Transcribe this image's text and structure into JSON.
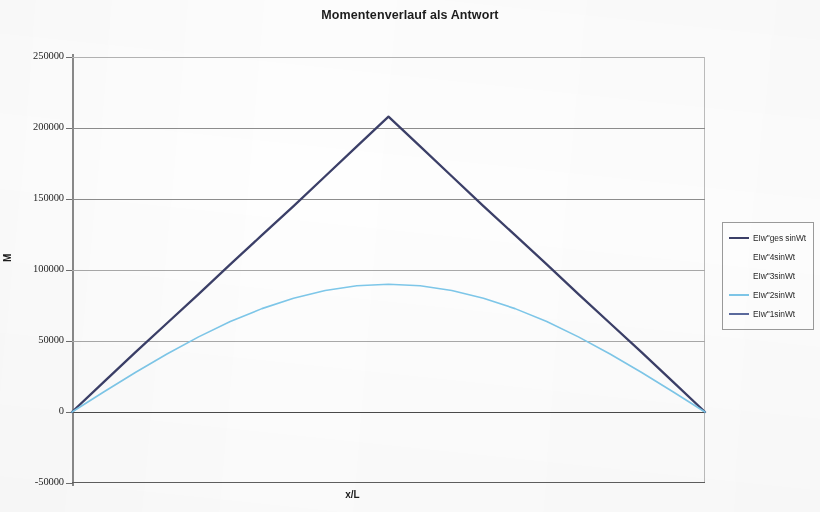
{
  "chart_data": {
    "type": "line",
    "title": "Momentenverlauf als Antwort",
    "xlabel": "x/L",
    "ylabel": "M",
    "ylim": [
      -50000,
      250000
    ],
    "xlim": [
      0,
      1
    ],
    "grid": true,
    "legend_position": "right",
    "y_ticks": [
      "250000",
      "200000",
      "150000",
      "100000",
      "50000",
      "0",
      "-50000"
    ],
    "y_tick_values": [
      250000,
      200000,
      150000,
      100000,
      50000,
      0,
      -50000
    ],
    "x": [
      0,
      0.05,
      0.1,
      0.15,
      0.2,
      0.25,
      0.3,
      0.35,
      0.4,
      0.45,
      0.5,
      0.55,
      0.6,
      0.65,
      0.7,
      0.75,
      0.8,
      0.85,
      0.9,
      0.95,
      1
    ],
    "series": [
      {
        "name": "EIw\"ges sinWt",
        "color": "#3b3f68",
        "width": 2.3,
        "visible": true,
        "values": [
          0,
          21000,
          42000,
          62500,
          83000,
          104000,
          124500,
          145000,
          166000,
          187000,
          208000,
          187000,
          166000,
          145000,
          124500,
          104000,
          83000,
          62500,
          42000,
          21000,
          0
        ]
      },
      {
        "name": "EIw\"4sinWt",
        "color": "#ffffff",
        "width": 1.2,
        "visible": false,
        "values": [
          0,
          0,
          0,
          0,
          0,
          0,
          0,
          0,
          0,
          0,
          0,
          0,
          0,
          0,
          0,
          0,
          0,
          0,
          0,
          0,
          0
        ]
      },
      {
        "name": "EIw\"3sinWt",
        "color": "#ffffff",
        "width": 1.2,
        "visible": false,
        "values": [
          0,
          0,
          0,
          0,
          0,
          0,
          0,
          0,
          0,
          0,
          0,
          0,
          0,
          0,
          0,
          0,
          0,
          0,
          0,
          0,
          0
        ]
      },
      {
        "name": "EIw\"2sinWt",
        "color": "#7ec8ea",
        "width": 1.6,
        "visible": true,
        "values": [
          0,
          14100,
          27800,
          40800,
          52900,
          63700,
          72800,
          80100,
          85600,
          88900,
          90000,
          88900,
          85600,
          80100,
          72800,
          63700,
          52900,
          40800,
          27800,
          14100,
          0
        ]
      },
      {
        "name": "EIw\"1sinWt",
        "color": "#5b6a9e",
        "width": 1.4,
        "visible": false,
        "values": [
          0,
          0,
          0,
          0,
          0,
          0,
          0,
          0,
          0,
          0,
          0,
          0,
          0,
          0,
          0,
          0,
          0,
          0,
          0,
          0,
          0
        ]
      }
    ],
    "annotations": {
      "peak_main": 208000,
      "peak_secondary": 90000
    }
  },
  "legend": {
    "items": [
      {
        "label": "EIw\"ges sinWt",
        "color": "#3b3f68",
        "show_swatch": true
      },
      {
        "label": "EIw\"4sinWt",
        "color": "#ffffff",
        "show_swatch": false
      },
      {
        "label": "EIw\"3sinWt",
        "color": "#ffffff",
        "show_swatch": false
      },
      {
        "label": "EIw\"2sinWt",
        "color": "#7ec8ea",
        "show_swatch": true
      },
      {
        "label": "EIw\"1sinWt",
        "color": "#5b6a9e",
        "show_swatch": true
      }
    ]
  }
}
